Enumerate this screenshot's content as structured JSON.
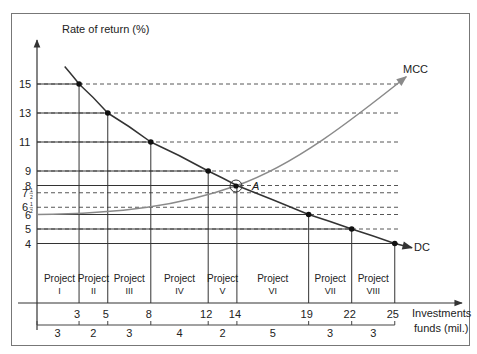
{
  "chart_data": {
    "type": "line",
    "title": "",
    "ylabel": "Rate of return (%)",
    "xlabel": "Investments funds (mil.)",
    "xlabel_lines": [
      "Investments",
      "funds (mil.)"
    ],
    "ylim": [
      0,
      17
    ],
    "xlim": [
      0,
      28
    ],
    "yticks": [
      "15",
      "13",
      "11",
      "9",
      "8",
      "7½",
      "6½",
      "6",
      "5",
      "4"
    ],
    "ytick_values": [
      15,
      13,
      11,
      9,
      8,
      7.5,
      6.5,
      6,
      5,
      4
    ],
    "xticks": [
      "3",
      "5",
      "8",
      "12",
      "14",
      "19",
      "22",
      "25"
    ],
    "xtick_values": [
      3,
      5,
      8,
      12,
      14,
      19,
      22,
      25
    ],
    "series": [
      {
        "name": "DC",
        "description": "Demand curve for capital (investment opportunity schedule)",
        "points": [
          [
            3,
            15
          ],
          [
            5,
            13
          ],
          [
            8,
            11
          ],
          [
            12,
            9
          ],
          [
            14,
            8
          ],
          [
            19,
            6
          ],
          [
            22,
            5
          ],
          [
            25,
            4
          ]
        ]
      },
      {
        "name": "MCC",
        "description": "Marginal cost of capital",
        "points": [
          [
            0,
            6
          ],
          [
            3,
            6
          ],
          [
            5,
            6.1
          ],
          [
            8,
            6.5
          ],
          [
            12,
            7.5
          ],
          [
            14,
            8
          ],
          [
            19,
            10
          ],
          [
            22,
            11.8
          ],
          [
            25,
            13.5
          ]
        ]
      }
    ],
    "intersection": {
      "label": "A",
      "x": 14,
      "y": 8
    },
    "projects": [
      {
        "name": "Project",
        "numeral": "I",
        "start": 0,
        "end": 3,
        "size": "3",
        "rate": 15
      },
      {
        "name": "Project",
        "numeral": "II",
        "start": 3,
        "end": 5,
        "size": "2",
        "rate": 13
      },
      {
        "name": "Project",
        "numeral": "III",
        "start": 5,
        "end": 8,
        "size": "3",
        "rate": 11
      },
      {
        "name": "Project",
        "numeral": "IV",
        "start": 8,
        "end": 12,
        "size": "4",
        "rate": 9
      },
      {
        "name": "Project",
        "numeral": "V",
        "start": 12,
        "end": 14,
        "size": "2",
        "rate": 8
      },
      {
        "name": "Project",
        "numeral": "VI",
        "start": 14,
        "end": 19,
        "size": "5",
        "rate": 6
      },
      {
        "name": "Project",
        "numeral": "VII",
        "start": 19,
        "end": 22,
        "size": "3",
        "rate": 5
      },
      {
        "name": "Project",
        "numeral": "VIII",
        "start": 22,
        "end": 25,
        "size": "3",
        "rate": 4
      }
    ],
    "grid": false,
    "legend": "inline labels (MCC upper right, DC right)"
  },
  "labels": {
    "y_axis": "Rate of return (%)",
    "x_axis_line1": "Investments",
    "x_axis_line2": "funds (mil.)",
    "mcc": "MCC",
    "dc": "DC",
    "point_a": "A"
  },
  "colors": {
    "dc_line": "#333333",
    "mcc_line": "#8a8a8a",
    "axis": "#333333",
    "frame": "#777777"
  }
}
